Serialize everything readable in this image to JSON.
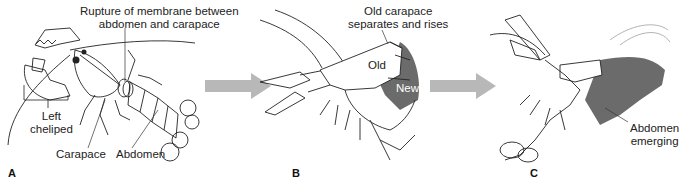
{
  "figure": {
    "colors": {
      "line": "#222222",
      "arrow": "#b8b8b8",
      "new_shell": "#6b6b6b",
      "background": "#ffffff"
    },
    "panels": [
      {
        "id": "A",
        "letter": "A",
        "labels": {
          "rupture_line1": "Rupture of membrane between",
          "rupture_line2": "abdomen and carapace",
          "cheliped_line1": "Left",
          "cheliped_line2": "cheliped",
          "carapace": "Carapace",
          "abdomen": "Abdomen"
        }
      },
      {
        "id": "B",
        "letter": "B",
        "labels": {
          "old_carapace_line1": "Old carapace",
          "old_carapace_line2": "separates and rises",
          "old": "Old",
          "new": "New"
        }
      },
      {
        "id": "C",
        "letter": "C",
        "labels": {
          "abdomen_emerging_line1": "Abdomen",
          "abdomen_emerging_line2": "emerging"
        }
      }
    ],
    "arrows": [
      {
        "id": "arrow-a-to-b",
        "icon": "right-arrow-icon"
      },
      {
        "id": "arrow-b-to-c",
        "icon": "right-arrow-icon"
      }
    ]
  }
}
